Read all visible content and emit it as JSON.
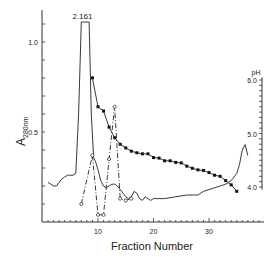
{
  "chart_data": {
    "type": "line",
    "title": "",
    "xlabel": "Fraction Number",
    "ylabel": "A280nm",
    "ylabel_main": "A",
    "ylabel_sub": "280nm",
    "y2label": "pH",
    "xlim": [
      0,
      39.5
    ],
    "ylim": [
      0,
      1.1
    ],
    "y2lim": [
      3.6,
      6.2
    ],
    "x_ticks": [
      10,
      20,
      30
    ],
    "y_ticks": [
      0.5,
      1.0
    ],
    "y_tick_labels": [
      "0.5",
      "1.0"
    ],
    "y2_ticks": [
      4.0,
      5.0,
      6.0
    ],
    "y2_tick_labels": [
      "4.0",
      "5.0",
      "6.0"
    ],
    "grid": false,
    "legend": null,
    "annotations": [
      {
        "text": "2.161",
        "x": 7.2,
        "y": 1.11,
        "note": "off-scale peak absorbance value"
      }
    ],
    "series": [
      {
        "name": "A280 (solid)",
        "axis": "left",
        "style": "solid",
        "x": [
          1,
          1.5,
          2,
          2.5,
          3,
          3.5,
          4,
          4.5,
          5,
          5.5,
          6,
          6.5,
          7,
          7.4,
          8.4,
          8.8,
          9.2,
          9.6,
          10,
          10.5,
          11,
          11.5,
          12,
          12.5,
          13,
          13.5,
          14,
          14.5,
          15,
          15.5,
          16,
          16.5,
          17,
          17.5,
          18,
          18.5,
          19,
          19.5,
          20,
          22,
          24,
          26,
          28,
          29,
          30,
          31,
          32,
          33,
          34,
          35,
          35.5,
          36,
          36.5,
          37
        ],
        "y": [
          0.22,
          0.21,
          0.2,
          0.2,
          0.22,
          0.24,
          0.25,
          0.26,
          0.26,
          0.26,
          0.27,
          0.6,
          1.1,
          1.1,
          1.1,
          0.6,
          0.36,
          0.33,
          0.29,
          0.23,
          0.2,
          0.19,
          0.2,
          0.21,
          0.21,
          0.2,
          0.18,
          0.16,
          0.14,
          0.13,
          0.14,
          0.17,
          0.16,
          0.13,
          0.12,
          0.14,
          0.13,
          0.12,
          0.13,
          0.13,
          0.14,
          0.15,
          0.15,
          0.17,
          0.18,
          0.19,
          0.2,
          0.21,
          0.23,
          0.27,
          0.32,
          0.4,
          0.43,
          0.37
        ]
      },
      {
        "name": "A280 (dash-dot, open circles)",
        "axis": "left",
        "style": "dash-dot",
        "marker": "open-circle",
        "x": [
          7,
          9,
          10,
          11,
          12,
          13,
          14,
          15,
          16
        ],
        "y": [
          0.1,
          0.37,
          0.04,
          0.04,
          0.35,
          0.64,
          0.13,
          0.12,
          0.13
        ]
      },
      {
        "name": "pH (filled squares)",
        "axis": "right",
        "style": "solid",
        "marker": "filled-square",
        "x": [
          9,
          10,
          11,
          12,
          13,
          14,
          15,
          16,
          17,
          18,
          19,
          20,
          21,
          22,
          23,
          24,
          25,
          26,
          27,
          28,
          29,
          30,
          31,
          32,
          33,
          34,
          35
        ],
        "y": [
          6.04,
          5.5,
          5.42,
          5.12,
          4.92,
          4.8,
          4.73,
          4.67,
          4.64,
          4.62,
          4.62,
          4.55,
          4.54,
          4.49,
          4.49,
          4.46,
          4.45,
          4.39,
          4.35,
          4.32,
          4.31,
          4.27,
          4.22,
          4.2,
          4.12,
          4.04,
          3.92
        ]
      }
    ]
  }
}
